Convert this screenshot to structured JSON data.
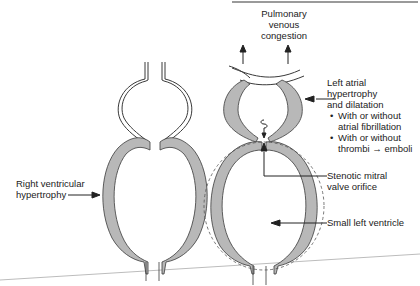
{
  "diagram": {
    "colors": {
      "wall_fill": "#b8b8b8",
      "outline": "#3a3a3a",
      "text": "#222222",
      "dashed": "#555555",
      "top_bar": "#9a9a9a",
      "baseline": "#bcbcbc"
    },
    "labels": {
      "pulmonary": {
        "line1": "Pulmonary",
        "line2": "venous",
        "line3": "congestion"
      },
      "left_atrial": {
        "line1": "Left atrial",
        "line2": "hypertrophy",
        "line3": "and dilatation",
        "bullets": [
          {
            "line1": "With or without",
            "line2": "atrial fibrillation"
          },
          {
            "line1": "With or without",
            "line2": "thrombi → emboli"
          }
        ]
      },
      "stenotic": {
        "line1": "Stenotic mitral",
        "line2": "valve orifice"
      },
      "small_lv": "Small left ventricle",
      "rv": {
        "line1": "Right ventricular",
        "line2": "hypertrophy"
      }
    },
    "nodes": [
      {
        "id": "right-atrium",
        "shape": "thin double-walled circle"
      },
      {
        "id": "right-ventricle",
        "shape": "thick shaded oval"
      },
      {
        "id": "left-atrium",
        "shape": "thick shaded crescent walls"
      },
      {
        "id": "left-ventricle",
        "shape": "thick shaded oval with dashed normal outline"
      },
      {
        "id": "pulmonary-veins",
        "shape": "curved vessel with upward arrows"
      }
    ]
  }
}
